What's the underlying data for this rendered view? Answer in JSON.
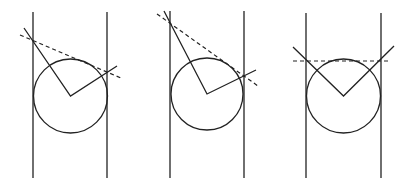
{
  "figure": {
    "panels": [
      {
        "id": "panel-1",
        "walls": [
          33,
          107
        ],
        "wall_y": [
          12,
          178
        ],
        "circle": {
          "cx": 70.5,
          "cy": 96,
          "r": 37
        },
        "solid": [
          [
            24,
            28
          ],
          [
            70.5,
            96
          ],
          [
            117,
            66
          ]
        ],
        "dashed": [
          [
            20,
            35
          ],
          [
            121,
            78
          ]
        ]
      },
      {
        "id": "panel-2",
        "walls": [
          170,
          244
        ],
        "wall_y": [
          11,
          178
        ],
        "circle": {
          "cx": 207,
          "cy": 94,
          "r": 36
        },
        "solid": [
          [
            164,
            11
          ],
          [
            207,
            94
          ],
          [
            256,
            70
          ]
        ],
        "dashed": [
          [
            157,
            14
          ],
          [
            258,
            86
          ]
        ]
      },
      {
        "id": "panel-3",
        "walls": [
          306,
          381
        ],
        "wall_y": [
          13,
          178
        ],
        "circle": {
          "cx": 343.5,
          "cy": 96,
          "r": 37
        },
        "solid": [
          [
            293,
            47
          ],
          [
            343.5,
            96
          ],
          [
            394,
            46
          ]
        ],
        "dashed": [
          [
            293,
            61
          ],
          [
            390,
            61
          ]
        ]
      }
    ]
  }
}
